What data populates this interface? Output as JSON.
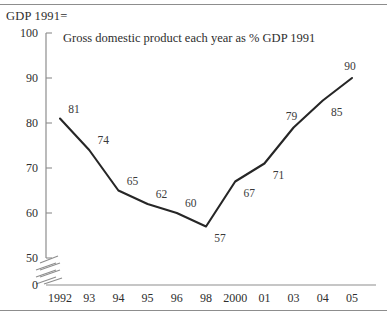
{
  "axis_header": "GDP 1991=",
  "chart_data": {
    "type": "line",
    "title": "Gross domestic product each year as % GDP 1991",
    "xlabel": "",
    "ylabel": "GDP 1991=",
    "categories": [
      "1992",
      "93",
      "94",
      "95",
      "96",
      "98",
      "2000",
      "01",
      "03",
      "04",
      "05"
    ],
    "values": [
      81,
      74,
      65,
      62,
      60,
      57,
      67,
      71,
      79,
      85,
      90
    ],
    "point_labels": [
      "81",
      "74",
      "65",
      "62",
      "60",
      "57",
      "67",
      "71",
      "79",
      "85",
      "90"
    ],
    "ylim": [
      0,
      100
    ],
    "yticks": [
      0,
      50,
      60,
      70,
      80,
      90,
      100
    ],
    "ytick_labels": [
      "0",
      "50",
      "60",
      "70",
      "80",
      "90",
      "100"
    ],
    "axis_break": true,
    "axis_break_between": [
      0,
      50
    ],
    "grid": false,
    "legend": "none",
    "line_color": "#262626",
    "axis_color": "#8d8d8d",
    "text_color": "#2e2e2e"
  }
}
